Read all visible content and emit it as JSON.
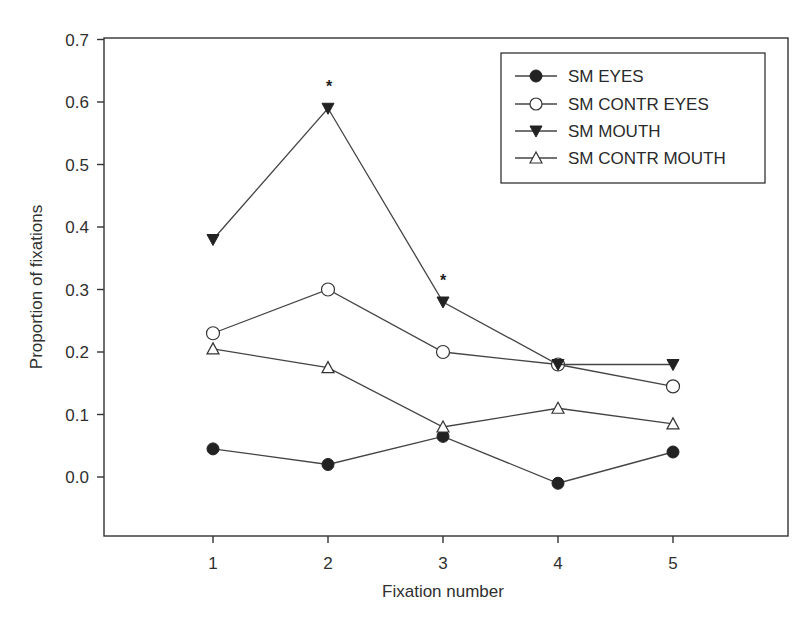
{
  "chart_data": {
    "type": "line",
    "title": "",
    "xlabel": "Fixation number",
    "ylabel": "Proportion of fixations",
    "x": [
      1,
      2,
      3,
      4,
      5
    ],
    "x_tick_labels": [
      "1",
      "2",
      "3",
      "4",
      "5"
    ],
    "y_tick_labels": [
      "0.0",
      "0.1",
      "0.2",
      "0.3",
      "0.4",
      "0.5",
      "0.6",
      "0.7"
    ],
    "y_ticks": [
      0.0,
      0.1,
      0.2,
      0.3,
      0.4,
      0.5,
      0.6,
      0.7
    ],
    "ylim": [
      -0.09,
      0.7
    ],
    "xlim": [
      0.0,
      6.0
    ],
    "grid": false,
    "legend_position": "upper right",
    "series": [
      {
        "name": "SM EYES",
        "marker": "filled-circle",
        "values": [
          0.045,
          0.02,
          0.065,
          -0.01,
          0.04
        ]
      },
      {
        "name": "SM CONTR EYES",
        "marker": "open-circle",
        "values": [
          0.23,
          0.3,
          0.2,
          0.18,
          0.145
        ]
      },
      {
        "name": "SM MOUTH",
        "marker": "filled-triangle-down",
        "values": [
          0.38,
          0.59,
          0.28,
          0.18,
          0.18
        ]
      },
      {
        "name": "SM CONTR MOUTH",
        "marker": "open-triangle-up",
        "values": [
          0.205,
          0.175,
          0.08,
          0.11,
          0.085
        ]
      }
    ],
    "annotations": [
      {
        "text": "*",
        "x": 2,
        "series": "SM MOUTH",
        "note": "significance marker"
      },
      {
        "text": "*",
        "x": 3,
        "series": "SM MOUTH",
        "note": "significance marker"
      }
    ]
  },
  "legend": {
    "items": [
      {
        "label": "SM EYES"
      },
      {
        "label": "SM CONTR EYES"
      },
      {
        "label": "SM MOUTH"
      },
      {
        "label": "SM CONTR MOUTH"
      }
    ]
  },
  "labels": {
    "xlabel": "Fixation number",
    "ylabel": "Proportion of fixations",
    "asterisk": "*"
  },
  "colors": {
    "line": "#444444",
    "marker_fill": "#222222",
    "axis": "#333333",
    "background": "#ffffff"
  }
}
